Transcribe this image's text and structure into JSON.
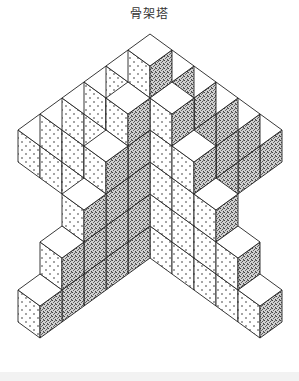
{
  "title": "骨架塔",
  "figure": {
    "center_height": 6,
    "arm_lengths": 5,
    "projection": {
      "origin": [
        150,
        34
      ],
      "x": [
        22,
        16
      ],
      "y": [
        -22,
        16
      ],
      "z": [
        0,
        -32
      ]
    },
    "faces": {
      "top": "#ffffff",
      "left": "dots-sparse",
      "right": "stipple-dense"
    },
    "colors": {
      "stroke": "#222222",
      "dot": "#333333",
      "stipple": "#555555",
      "background": "#ffffff",
      "footer": "#f2f2f2"
    }
  }
}
